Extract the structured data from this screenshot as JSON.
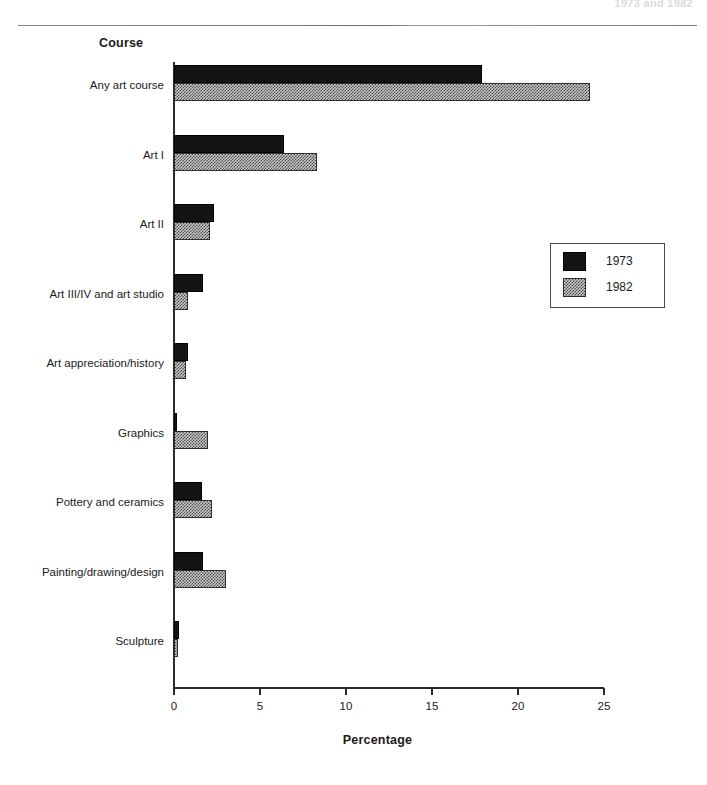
{
  "page": {
    "running_header": "1973 and 1982"
  },
  "chart_data": {
    "type": "bar",
    "orientation": "horizontal",
    "title": "",
    "xlabel": "Percentage",
    "ylabel": "Course",
    "xlim": [
      0,
      25
    ],
    "xticks": [
      0,
      5,
      10,
      15,
      20,
      25
    ],
    "xtick_labels": [
      "0",
      "5",
      "10",
      "15",
      "20",
      "25"
    ],
    "grid": false,
    "legend_position": "right",
    "categories": [
      "Any art course",
      "Art I",
      "Art II",
      "Art III/IV and art studio",
      "Art appreciation/history",
      "Graphics",
      "Pottery and ceramics",
      "Painting/drawing/design",
      "Sculpture"
    ],
    "series": [
      {
        "name": "1973",
        "color": "#141414",
        "pattern": "solid",
        "values": [
          17.9,
          6.4,
          2.3,
          1.7,
          0.8,
          0.2,
          1.6,
          1.7,
          0.3
        ]
      },
      {
        "name": "1982",
        "color": "#c9c9c9",
        "pattern": "checker",
        "values": [
          24.2,
          8.3,
          2.1,
          0.8,
          0.7,
          2.0,
          2.2,
          3.0,
          0.25
        ]
      }
    ]
  }
}
